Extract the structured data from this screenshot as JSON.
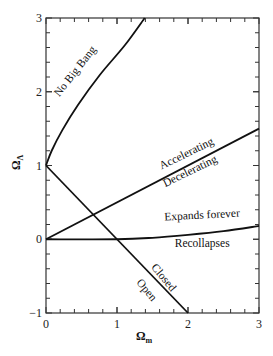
{
  "chart_data": {
    "type": "line",
    "title": "",
    "xlabel": "Ω_m",
    "ylabel": "Ω_Λ",
    "xlabel_main": "Ω",
    "xlabel_sub": "m",
    "ylabel_main": "Ω",
    "ylabel_sub": "Λ",
    "xlim": [
      0,
      3
    ],
    "ylim": [
      -1,
      3
    ],
    "xticks": [
      0,
      1,
      2,
      3
    ],
    "yticks": [
      -1,
      0,
      1,
      2,
      3
    ],
    "xtick_labels": [
      "0",
      "1",
      "2",
      "3"
    ],
    "ytick_labels": [
      "−1",
      "0",
      "1",
      "2",
      "3"
    ],
    "minor_ticks_per_major": 5,
    "grid": false,
    "legend": null,
    "series": [
      {
        "name": "No Big Bang boundary",
        "x": [
          0,
          0.08,
          0.23,
          0.45,
          0.76,
          1.11,
          1.39
        ],
        "y": [
          1.0,
          1.2,
          1.48,
          1.82,
          2.23,
          2.63,
          3.0
        ]
      },
      {
        "name": "Accelerating / Decelerating boundary",
        "x": [
          0,
          3
        ],
        "y": [
          0,
          1.5
        ]
      },
      {
        "name": "Expands forever / Recollapses boundary",
        "x": [
          0,
          1,
          1.5,
          2,
          2.5,
          3
        ],
        "y": [
          0,
          0,
          0.02,
          0.06,
          0.11,
          0.18
        ]
      },
      {
        "name": "Closed / Open boundary",
        "x": [
          0,
          2
        ],
        "y": [
          1,
          -1
        ]
      }
    ],
    "annotations": [
      {
        "text": "No Big Bang",
        "x": 0.45,
        "y": 2.25,
        "angle": -52
      },
      {
        "text": "Accelerating",
        "x": 2.0,
        "y": 1.12,
        "angle": -26
      },
      {
        "text": "Decelerating",
        "x": 2.05,
        "y": 0.88,
        "angle": -26
      },
      {
        "text": "Expands forever",
        "x": 2.2,
        "y": 0.28,
        "angle": -3
      },
      {
        "text": "Recollapses",
        "x": 2.2,
        "y": -0.1,
        "angle": 0
      },
      {
        "text": "Closed",
        "x": 1.62,
        "y": -0.55,
        "angle": 50
      },
      {
        "text": "Open",
        "x": 1.38,
        "y": -0.72,
        "angle": 50
      }
    ]
  },
  "colors": {
    "line": "#111111",
    "axis": "#333333",
    "background": "#ffffff"
  }
}
